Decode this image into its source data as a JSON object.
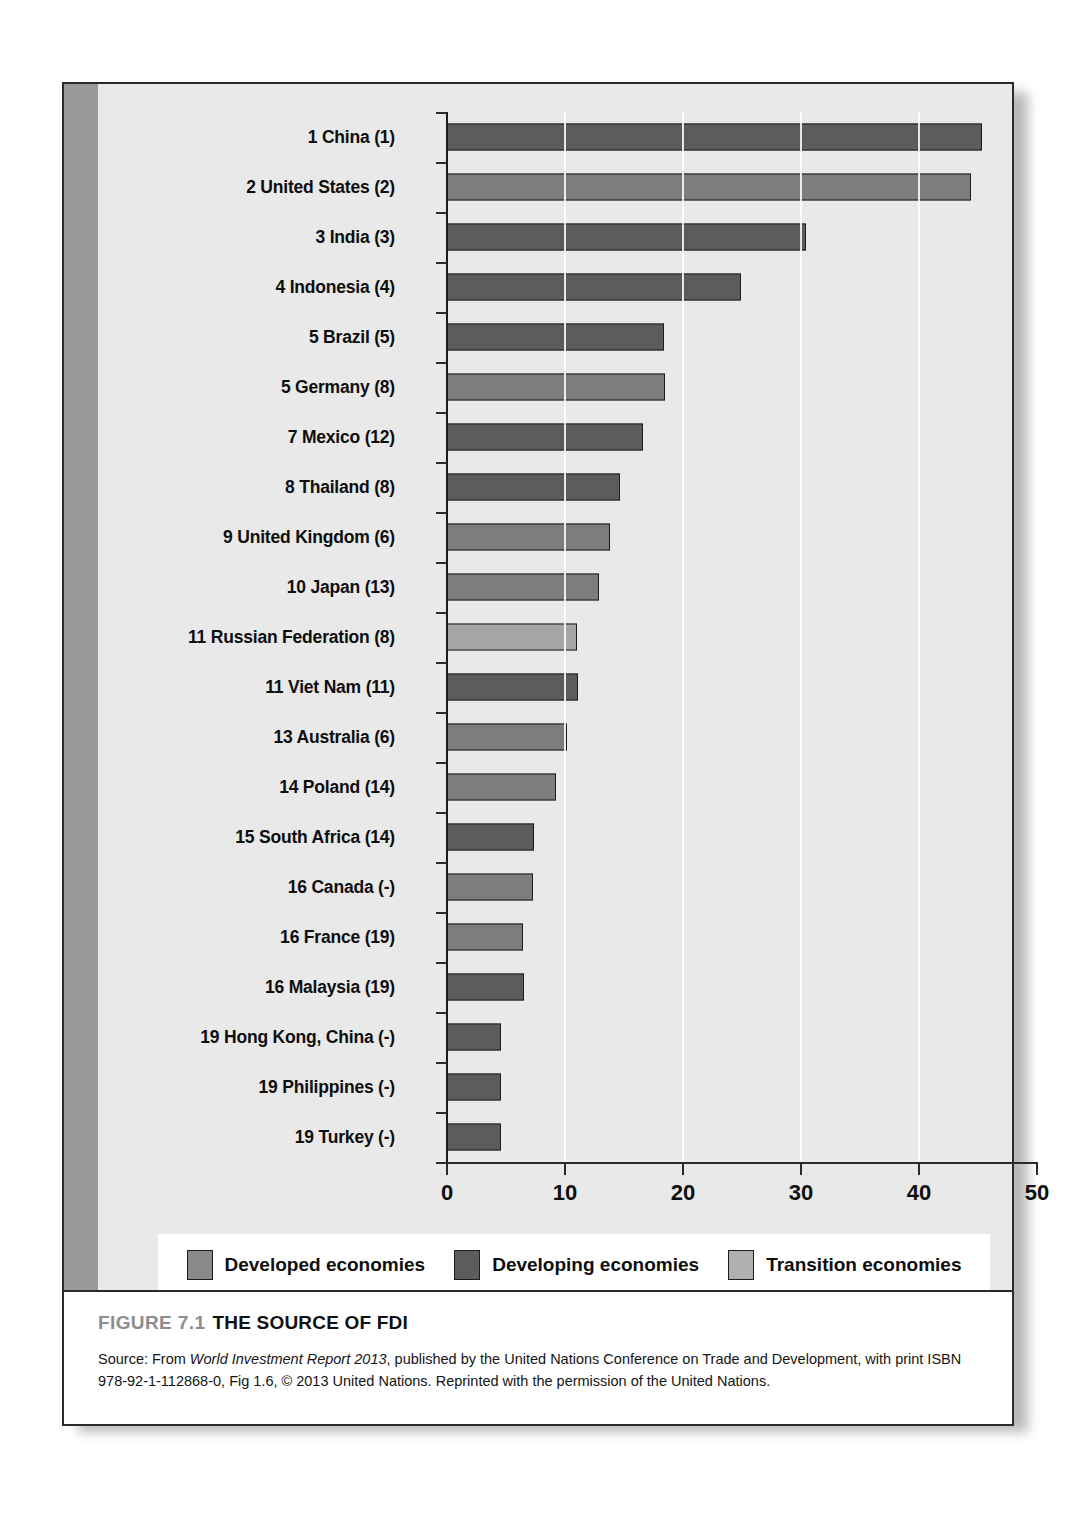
{
  "figure": {
    "number": "FIGURE 7.1",
    "title": "THE SOURCE OF FDI",
    "source_prefix": "Source: From ",
    "source_italic": "World Investment Report 2013",
    "source_rest": ", published by the United Nations Conference on Trade and Development, with print ISBN 978-92-1-112868-0, Fig 1.6, © 2013 United Nations. Reprinted with the permission of the United Nations."
  },
  "legend": {
    "items": [
      {
        "label": "Developed economies",
        "key": "developed",
        "color": "#8a8a8a"
      },
      {
        "label": "Developing economies",
        "key": "developing",
        "color": "#5c5c5c"
      },
      {
        "label": "Transition economies",
        "key": "transition",
        "color": "#b0b0b0"
      }
    ]
  },
  "chart_data": {
    "type": "bar",
    "orientation": "horizontal",
    "title": "THE SOURCE OF FDI",
    "xlabel": "",
    "ylabel": "",
    "xlim": [
      0,
      50
    ],
    "xticks": [
      0,
      10,
      20,
      30,
      40,
      50
    ],
    "xticklabels": [
      "0",
      "10",
      "20",
      "30",
      "40",
      "50"
    ],
    "grid": "vertical",
    "legend_position": "bottom",
    "categories": [
      "1 China (1)",
      "2 United States (2)",
      "3 India (3)",
      "4 Indonesia (4)",
      "5 Brazil (5)",
      "5 Germany (8)",
      "7 Mexico (12)",
      "8 Thailand (8)",
      "9 United Kingdom (6)",
      "10 Japan (13)",
      "11 Russian Federation (8)",
      "11 Viet Nam (11)",
      "13 Australia (6)",
      "14 Poland (14)",
      "15 South Africa (14)",
      "16 Canada (-)",
      "16 France (19)",
      "16 Malaysia (19)",
      "19 Hong Kong, China (-)",
      "19 Philippines (-)",
      "19 Turkey (-)"
    ],
    "values": [
      45.3,
      44.4,
      30.4,
      24.9,
      18.4,
      18.5,
      16.6,
      14.7,
      13.8,
      12.9,
      11.0,
      11.1,
      10.2,
      9.2,
      7.4,
      7.3,
      6.4,
      6.5,
      4.6,
      4.6,
      4.6
    ],
    "groups": [
      "developing",
      "developed",
      "developing",
      "developing",
      "developing",
      "developed",
      "developing",
      "developing",
      "developed",
      "developed",
      "transition",
      "developing",
      "developed",
      "developed",
      "developing",
      "developed",
      "developed",
      "developing",
      "developing",
      "developing",
      "developing"
    ]
  }
}
